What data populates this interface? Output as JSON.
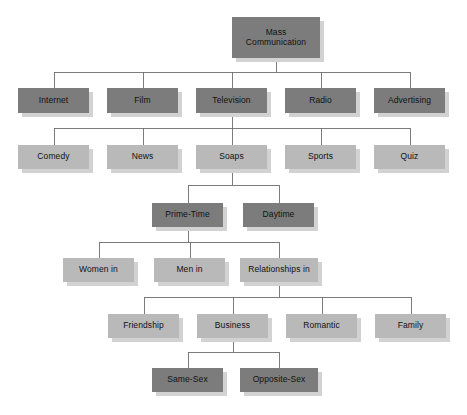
{
  "diagram": {
    "type": "tree",
    "colors": {
      "dark_box": "#7c7c7c",
      "light_box": "#b9b9b9",
      "shadow": "#d2d2d2",
      "line": "#6e6e6e",
      "text": "#111111",
      "background": "#ffffff"
    },
    "levels": [
      {
        "index": 0,
        "label": "root",
        "style": "dark"
      },
      {
        "index": 1,
        "label": "media",
        "style": "dark"
      },
      {
        "index": 2,
        "label": "genres",
        "style": "light"
      },
      {
        "index": 3,
        "label": "scheduling",
        "style": "dark"
      },
      {
        "index": 4,
        "label": "portrayals",
        "style": "light"
      },
      {
        "index": 5,
        "label": "relationship-types",
        "style": "light"
      },
      {
        "index": 6,
        "label": "sex-composition",
        "style": "dark"
      }
    ],
    "nodes": [
      {
        "id": "mass-communication",
        "label": "Mass\nCommunication",
        "level": 0,
        "style": "dark",
        "x": 232,
        "y": 17,
        "w": 88,
        "h": 41,
        "font": 8.5
      },
      {
        "id": "internet",
        "label": "Internet",
        "level": 1,
        "style": "dark",
        "x": 18,
        "y": 88,
        "w": 71,
        "h": 25,
        "font": 8.5
      },
      {
        "id": "film",
        "label": "Film",
        "level": 1,
        "style": "dark",
        "x": 107,
        "y": 88,
        "w": 71,
        "h": 25,
        "font": 8.5
      },
      {
        "id": "television",
        "label": "Television",
        "level": 1,
        "style": "dark",
        "x": 196,
        "y": 88,
        "w": 71,
        "h": 25,
        "font": 8.5
      },
      {
        "id": "radio",
        "label": "Radio",
        "level": 1,
        "style": "dark",
        "x": 285,
        "y": 88,
        "w": 71,
        "h": 25,
        "font": 8.5
      },
      {
        "id": "advertising",
        "label": "Advertising",
        "level": 1,
        "style": "dark",
        "x": 374,
        "y": 88,
        "w": 71,
        "h": 25,
        "font": 8.5
      },
      {
        "id": "comedy",
        "label": "Comedy",
        "level": 2,
        "style": "light",
        "x": 18,
        "y": 145,
        "w": 71,
        "h": 24,
        "font": 8.5
      },
      {
        "id": "news",
        "label": "News",
        "level": 2,
        "style": "light",
        "x": 107,
        "y": 145,
        "w": 71,
        "h": 24,
        "font": 8.5
      },
      {
        "id": "soaps",
        "label": "Soaps",
        "level": 2,
        "style": "light",
        "x": 196,
        "y": 145,
        "w": 71,
        "h": 24,
        "font": 8.5
      },
      {
        "id": "sports",
        "label": "Sports",
        "level": 2,
        "style": "light",
        "x": 285,
        "y": 145,
        "w": 71,
        "h": 24,
        "font": 8.5
      },
      {
        "id": "quiz",
        "label": "Quiz",
        "level": 2,
        "style": "light",
        "x": 374,
        "y": 145,
        "w": 71,
        "h": 24,
        "font": 8.5
      },
      {
        "id": "prime-time",
        "label": "Prime-Time",
        "level": 3,
        "style": "dark",
        "x": 152,
        "y": 203,
        "w": 71,
        "h": 24,
        "font": 8.5
      },
      {
        "id": "daytime",
        "label": "Daytime",
        "level": 3,
        "style": "dark",
        "x": 243,
        "y": 203,
        "w": 71,
        "h": 24,
        "font": 8.5
      },
      {
        "id": "women-in",
        "label": "Women in",
        "level": 4,
        "style": "light",
        "x": 63,
        "y": 258,
        "w": 71,
        "h": 24,
        "font": 8.5
      },
      {
        "id": "men-in",
        "label": "Men in",
        "level": 4,
        "style": "light",
        "x": 154,
        "y": 258,
        "w": 71,
        "h": 24,
        "font": 8.5
      },
      {
        "id": "relationships-in",
        "label": "Relationships in",
        "level": 4,
        "style": "light",
        "x": 240,
        "y": 258,
        "w": 78,
        "h": 24,
        "font": 8.5
      },
      {
        "id": "friendship",
        "label": "Friendship",
        "level": 5,
        "style": "light",
        "x": 108,
        "y": 314,
        "w": 71,
        "h": 24,
        "font": 8.5
      },
      {
        "id": "business",
        "label": "Business",
        "level": 5,
        "style": "light",
        "x": 197,
        "y": 314,
        "w": 71,
        "h": 24,
        "font": 8.5
      },
      {
        "id": "romantic",
        "label": "Romantic",
        "level": 5,
        "style": "light",
        "x": 286,
        "y": 314,
        "w": 71,
        "h": 24,
        "font": 8.5
      },
      {
        "id": "family",
        "label": "Family",
        "level": 5,
        "style": "light",
        "x": 375,
        "y": 314,
        "w": 71,
        "h": 24,
        "font": 8.5
      },
      {
        "id": "same-sex",
        "label": "Same-Sex",
        "level": 6,
        "style": "dark",
        "x": 152,
        "y": 368,
        "w": 71,
        "h": 24,
        "font": 8.5
      },
      {
        "id": "opposite-sex",
        "label": "Opposite-Sex",
        "level": 6,
        "style": "dark",
        "x": 240,
        "y": 368,
        "w": 78,
        "h": 24,
        "font": 8.5
      }
    ],
    "edges": [
      {
        "from": "mass-communication",
        "to": [
          "internet",
          "film",
          "television",
          "radio",
          "advertising"
        ]
      },
      {
        "from": "television",
        "to": [
          "comedy",
          "news",
          "soaps",
          "sports",
          "quiz"
        ]
      },
      {
        "from": "soaps",
        "to": [
          "prime-time",
          "daytime"
        ]
      },
      {
        "from": "prime-time",
        "to": [
          "women-in",
          "men-in",
          "relationships-in"
        ]
      },
      {
        "from": "relationships-in",
        "to": [
          "friendship",
          "business",
          "romantic",
          "family"
        ]
      },
      {
        "from": "business",
        "to": [
          "same-sex",
          "opposite-sex"
        ]
      }
    ]
  }
}
